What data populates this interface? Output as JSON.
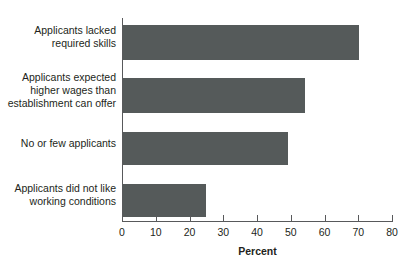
{
  "chart_data": {
    "type": "bar",
    "orientation": "horizontal",
    "title": "",
    "xlabel": "Percent",
    "ylabel": "",
    "categories": [
      "Applicants lacked required skills",
      "Applicants expected higher wages than establishment can offer",
      "No or few applicants",
      "Applicants did not like working conditions"
    ],
    "values": [
      70,
      54,
      49,
      24.5
    ],
    "xlim": [
      0,
      80
    ],
    "xticks": [
      0,
      10,
      20,
      30,
      40,
      50,
      60,
      70,
      80
    ],
    "xtick_labels": [
      "0",
      "10",
      "20",
      "30",
      "40",
      "50",
      "60",
      "70",
      "80"
    ],
    "grid": false,
    "legend": false,
    "bar_color": "#555a5a",
    "axis_color": "#58595b"
  },
  "axis": {
    "x_title": "Percent"
  },
  "categories": [
    {
      "lines": [
        "Applicants lacked",
        "required skills"
      ]
    },
    {
      "lines": [
        "Applicants expected",
        "higher wages than",
        "establishment can offer"
      ]
    },
    {
      "lines": [
        "No or few applicants"
      ]
    },
    {
      "lines": [
        "Applicants did not like",
        "working conditions"
      ]
    }
  ],
  "ticks": [
    {
      "label": "0"
    },
    {
      "label": "10"
    },
    {
      "label": "20"
    },
    {
      "label": "30"
    },
    {
      "label": "40"
    },
    {
      "label": "50"
    },
    {
      "label": "60"
    },
    {
      "label": "70"
    },
    {
      "label": "80"
    }
  ],
  "title": {
    "text": ""
  }
}
